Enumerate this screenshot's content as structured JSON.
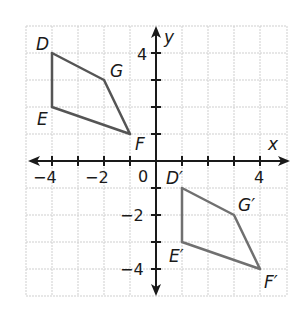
{
  "figure": {
    "axes": {
      "x_label": "x",
      "y_label": "y",
      "origin_label": "0"
    },
    "x_ticks": [
      {
        "value": -4,
        "label": "−4"
      },
      {
        "value": -2,
        "label": "−2"
      },
      {
        "value": 4,
        "label": "4"
      }
    ],
    "y_ticks": [
      {
        "value": 4,
        "label": "4"
      },
      {
        "value": -2,
        "label": "−2"
      },
      {
        "value": -4,
        "label": "−4"
      }
    ],
    "grid_range": {
      "xmin": -5,
      "xmax": 5,
      "ymin": -5,
      "ymax": 5
    },
    "shapes": [
      {
        "name": "DEFG",
        "color": "#555555",
        "vertices": [
          {
            "label": "D",
            "x": -4,
            "y": 4
          },
          {
            "label": "G",
            "x": -2,
            "y": 3
          },
          {
            "label": "F",
            "x": -1,
            "y": 1
          },
          {
            "label": "E",
            "x": -4,
            "y": 2
          }
        ]
      },
      {
        "name": "D'E'F'G'",
        "color": "#707070",
        "vertices": [
          {
            "label": "D′",
            "x": 1,
            "y": -1
          },
          {
            "label": "G′",
            "x": 3,
            "y": -2
          },
          {
            "label": "F′",
            "x": 4,
            "y": -4
          },
          {
            "label": "E′",
            "x": 1,
            "y": -3
          }
        ]
      }
    ]
  }
}
